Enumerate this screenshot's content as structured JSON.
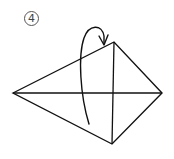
{
  "diagram": {
    "step_number": "4",
    "colors": {
      "line": "#111111",
      "background": "#ffffff",
      "badge": "#555555"
    },
    "shape": {
      "type": "kite",
      "vertices": {
        "left": [
          13,
          93
        ],
        "top": [
          114,
          42
        ],
        "right": [
          162,
          93
        ],
        "bottom": [
          112,
          144
        ]
      }
    },
    "crease_lines": [
      {
        "name": "horizontal-diagonal",
        "from": [
          13,
          93
        ],
        "to": [
          162,
          93
        ]
      },
      {
        "name": "vertical-diagonal",
        "from": [
          114,
          42
        ],
        "to": [
          112,
          144
        ]
      }
    ],
    "arrow": {
      "type": "fold-over",
      "start": [
        89,
        124
      ],
      "peak": [
        96,
        27
      ],
      "head": [
        104,
        44
      ],
      "direction": "up-and-over to the right"
    }
  }
}
